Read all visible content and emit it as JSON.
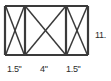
{
  "figure": {
    "kind": "braced-frame-elevation",
    "background_color": "#ffffff",
    "line_color": "#3a3a3a",
    "text_color": "#2b2b2b"
  },
  "geometry": {
    "frame": {
      "x1": 5,
      "y1": 6,
      "x2": 88,
      "y2": 55
    },
    "posts_x": [
      25,
      66
    ],
    "bays": [
      {
        "name": "left-bay",
        "x1": 5,
        "x2": 25,
        "braced": true
      },
      {
        "name": "mid-bay",
        "x1": 25,
        "x2": 66,
        "braced": true
      },
      {
        "name": "right-bay",
        "x1": 66,
        "x2": 88,
        "braced": true
      }
    ]
  },
  "dimensions": {
    "bottom": [
      {
        "name": "left-bay-width",
        "value": "1.5\""
      },
      {
        "name": "mid-bay-width",
        "value": "4\""
      },
      {
        "name": "right-bay-width",
        "value": "1.5\""
      }
    ],
    "right": {
      "name": "overall-height",
      "value": "11."
    }
  }
}
